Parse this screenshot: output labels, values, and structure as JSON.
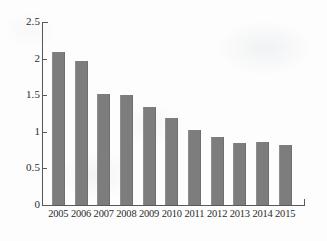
{
  "chart_data": {
    "type": "bar",
    "title": "",
    "subtitle": "",
    "xlabel": "",
    "ylabel": "",
    "categories": [
      "2005",
      "2006",
      "2007",
      "2008",
      "2009",
      "2010",
      "2011",
      "2012",
      "2013",
      "2014",
      "2015"
    ],
    "values": [
      2.09,
      1.97,
      1.52,
      1.5,
      1.34,
      1.19,
      1.02,
      0.93,
      0.85,
      0.86,
      0.82
    ],
    "series": [
      {
        "name": "",
        "values": [
          2.09,
          1.97,
          1.52,
          1.5,
          1.34,
          1.19,
          1.02,
          0.93,
          0.85,
          0.86,
          0.82
        ]
      }
    ],
    "ylim": [
      0,
      2.5
    ],
    "yticks": [
      0,
      0.5,
      1,
      1.5,
      2,
      2.5
    ],
    "ytick_labels": [
      "0",
      "0.5",
      "1",
      "1.5",
      "2",
      "2.5"
    ],
    "xtick_labels": [
      "2005",
      "2006",
      "2007",
      "2008",
      "2009",
      "2010",
      "2011",
      "2012",
      "2013",
      "2014",
      "2015"
    ],
    "grid": false,
    "legend": false,
    "legend_position": "none",
    "bar_color": "#7d7d7d",
    "axis_color": "#585858",
    "background_color": "#fdfdfd",
    "text_color": "#2b2b2b"
  }
}
